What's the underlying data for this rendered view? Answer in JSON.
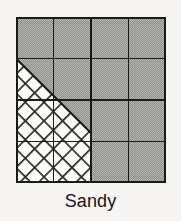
{
  "figure": {
    "caption": "Sandy",
    "soil_texture_triangle": {
      "label": "Sandy",
      "grid": {
        "columns": 4,
        "rows": 4,
        "cell_width": 37.5,
        "cell_height": 41.5,
        "line_color": "#1a1a18",
        "line_width": 1.6,
        "border_width": 2.2
      },
      "fills": {
        "shaded_color": "#a2a2a0",
        "shaded_label": "gray-dither-fill",
        "hatched_color": "#ffffff",
        "hatch_line_color": "#2b2b28",
        "hatch_label": "cross-hatch-fill",
        "background": "#f6f5f3"
      },
      "diagonal": {
        "label": "hypotenuse",
        "from_x": 0,
        "from_y": 41.5,
        "to_x": 75,
        "to_y": 116,
        "color": "#1a1a18",
        "width": 2.0
      },
      "regions": [
        {
          "name": "shaded-upper-right",
          "label": "shaded",
          "fill": "gray-dither-fill"
        },
        {
          "name": "hatched-lower-left",
          "label": "hatched",
          "fill": "cross-hatch-fill"
        }
      ]
    }
  }
}
